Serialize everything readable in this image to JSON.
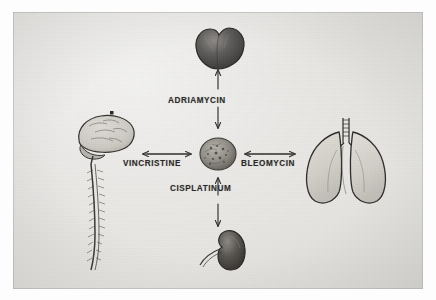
{
  "image": {
    "type": "photograph-of-hand-drawn-diagram",
    "width": 436,
    "height": 300,
    "paper_color": "#e7e6e3",
    "border_color": "#ffffff",
    "ink_color": "#2b2a28"
  },
  "diagram": {
    "kind": "radial-relationship-diagram",
    "center": {
      "name": "tumor",
      "shape": "stippled round mass",
      "label": ""
    },
    "arrows": {
      "style": "double-headed",
      "count": 4,
      "directions": [
        "up",
        "left",
        "right",
        "down"
      ]
    },
    "edges": [
      {
        "id": "edge-up",
        "label": "ADRIAMYCIN",
        "direction": "up",
        "from": "tumor",
        "to": "heart"
      },
      {
        "id": "edge-left",
        "label": "VINCRISTINE",
        "direction": "left",
        "from": "tumor",
        "to": "brain"
      },
      {
        "id": "edge-right",
        "label": "BLEOMYCIN",
        "direction": "right",
        "from": "tumor",
        "to": "lungs"
      },
      {
        "id": "edge-down",
        "label": "CISPLATINUM",
        "direction": "down",
        "from": "tumor",
        "to": "kidney"
      }
    ],
    "organs": [
      {
        "id": "heart",
        "name": "heart",
        "position": "top",
        "shading": "dark"
      },
      {
        "id": "brain",
        "name": "brain-and-spinal-cord",
        "position": "left",
        "shading": "light"
      },
      {
        "id": "lungs",
        "name": "lungs",
        "position": "right",
        "shading": "light"
      },
      {
        "id": "kidney",
        "name": "kidney",
        "position": "bottom",
        "shading": "dark"
      }
    ]
  }
}
